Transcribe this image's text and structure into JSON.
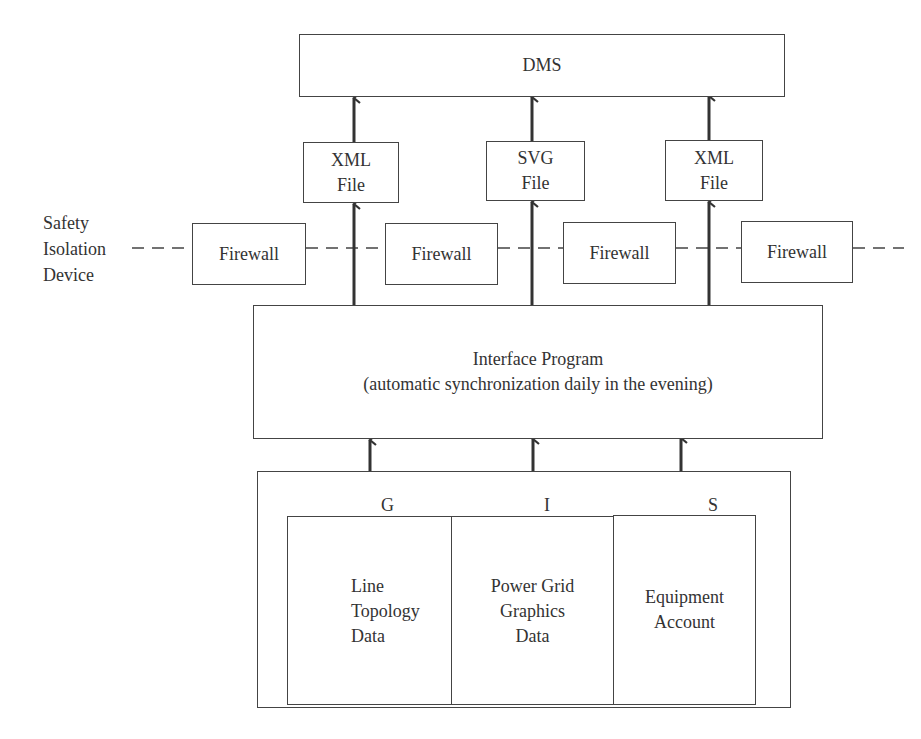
{
  "diagram": {
    "top_system": {
      "label": "DMS"
    },
    "files": [
      {
        "line1": "XML",
        "line2": "File"
      },
      {
        "line1": "SVG",
        "line2": "File"
      },
      {
        "line1": "XML",
        "line2": "File"
      }
    ],
    "isolation": {
      "label_lines": [
        "Safety",
        "Isolation",
        "Device"
      ],
      "firewalls": [
        "Firewall",
        "Firewall",
        "Firewall",
        "Firewall"
      ]
    },
    "interface": {
      "title": "Interface Program",
      "subtitle": "(automatic synchronization daily in the evening)"
    },
    "gis": {
      "letters": [
        "G",
        "I",
        "S"
      ],
      "columns": [
        {
          "lines": [
            "Line",
            "Topology",
            "Data"
          ]
        },
        {
          "lines": [
            "Power Grid",
            "Graphics",
            "Data"
          ]
        },
        {
          "lines": [
            "Equipment",
            "Account"
          ]
        }
      ]
    },
    "colors": {
      "stroke": "#444444",
      "text": "#333333",
      "background": "#ffffff"
    }
  }
}
